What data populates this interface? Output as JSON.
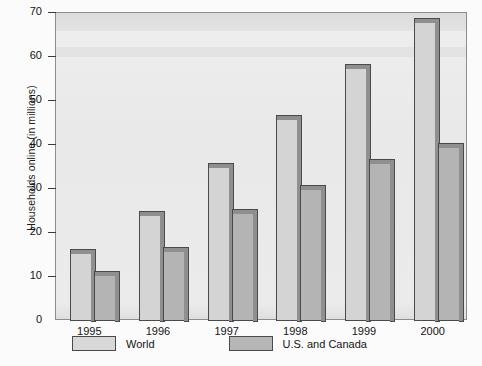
{
  "chart_data": {
    "type": "bar",
    "title": "",
    "xlabel": "",
    "ylabel": "Households online (in millions)",
    "categories": [
      "1995",
      "1996",
      "1997",
      "1998",
      "1999",
      "2000"
    ],
    "series": [
      {
        "name": "World",
        "values": [
          15.5,
          24,
          35,
          46,
          57.5,
          68
        ]
      },
      {
        "name": "U.S. and Canada",
        "values": [
          10.5,
          16,
          24.5,
          30,
          36,
          39.5
        ]
      }
    ],
    "ylim": [
      0,
      70
    ],
    "yticks": [
      0,
      10,
      20,
      30,
      40,
      50,
      60,
      70
    ],
    "ytick_labels": [
      "0",
      "10",
      "20",
      "30",
      "40",
      "50",
      "60",
      "70"
    ],
    "grid": false,
    "legend_position": "bottom",
    "colors": {
      "world": "#d4d4d4",
      "us_and_canada": "#b4b4b4",
      "bar_outline": "#4a4a4a",
      "bar_shadow": "#8f8f8f",
      "plot_background": "#ececec",
      "axis": "#3a3a3a",
      "text": "#141414",
      "page_background": "#fbfbfb"
    }
  },
  "legend": {
    "items": [
      {
        "label": "World",
        "swatch": "world-swatch"
      },
      {
        "label": "U.S. and Canada",
        "swatch": "us-canada-swatch"
      }
    ]
  },
  "axes": {
    "y_title": "Households online (in millions)"
  }
}
